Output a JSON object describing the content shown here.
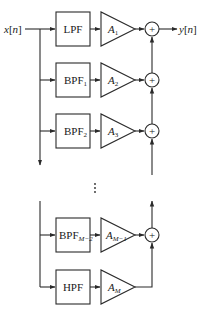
{
  "diagram": {
    "type": "filter-bank block diagram",
    "input_label": "x[n]",
    "output_label": "y[n]",
    "colors": {
      "line": "#2a2a2a",
      "background": "#ffffff"
    },
    "rows": [
      {
        "filter": "LPF",
        "filter_sub": "",
        "gain": "A",
        "gain_sub": "1"
      },
      {
        "filter": "BPF",
        "filter_sub": "1",
        "gain": "A",
        "gain_sub": "2"
      },
      {
        "filter": "BPF",
        "filter_sub": "2",
        "gain": "A",
        "gain_sub": "3"
      },
      {
        "filter": "BPF",
        "filter_sub": "M−2",
        "gain": "A",
        "gain_sub": "M−1"
      },
      {
        "filter": "HPF",
        "filter_sub": "",
        "gain": "A",
        "gain_sub": "M"
      }
    ],
    "summer_symbol": "+",
    "ellipsis": "⋮"
  }
}
